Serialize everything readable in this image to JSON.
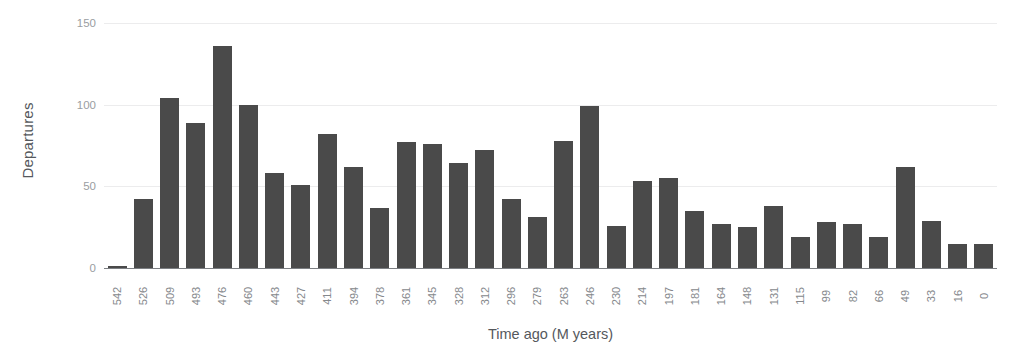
{
  "chart_data": {
    "type": "bar",
    "title": "",
    "xlabel": "Time ago (M years)",
    "ylabel": "Departures",
    "ylim": [
      0,
      150
    ],
    "yticks": [
      0,
      50,
      100,
      150
    ],
    "grid": true,
    "legend": false,
    "bar_color": "#4a4a4a",
    "gridline_color": "#ececed",
    "axis_color": "#7c7f83",
    "categories": [
      "542",
      "526",
      "509",
      "493",
      "476",
      "460",
      "443",
      "427",
      "411",
      "394",
      "378",
      "361",
      "345",
      "328",
      "312",
      "296",
      "279",
      "263",
      "246",
      "230",
      "214",
      "197",
      "181",
      "164",
      "148",
      "131",
      "115",
      "99",
      "82",
      "66",
      "49",
      "33",
      "16",
      "0"
    ],
    "values": [
      1,
      42,
      104,
      89,
      136,
      100,
      58,
      51,
      82,
      62,
      37,
      77,
      76,
      64,
      72,
      42,
      31,
      78,
      99,
      26,
      53,
      55,
      35,
      27,
      25,
      38,
      19,
      28,
      27,
      19,
      62,
      29,
      15,
      15
    ]
  }
}
